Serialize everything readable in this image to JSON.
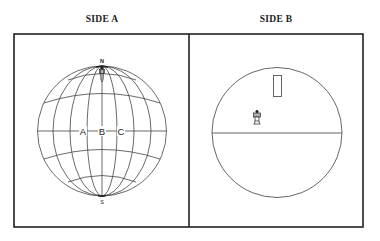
{
  "panels": {
    "side_a": {
      "title": "SIDE A",
      "globe": {
        "north_label": "N",
        "south_label": "S",
        "equator_labels": [
          "A",
          "B",
          "C"
        ]
      }
    },
    "side_b": {
      "title": "SIDE B"
    }
  },
  "colors": {
    "line": "#333333",
    "frame": "#222222",
    "background": "#ffffff"
  }
}
